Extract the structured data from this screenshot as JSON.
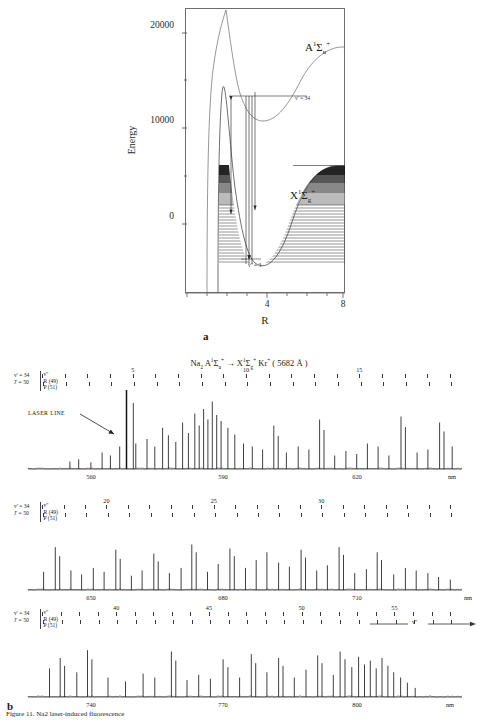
{
  "figure": {
    "caption": "Figure 11. Na2 laser-induced fluorescence",
    "panel_a_label": "a",
    "panel_b_label": "b"
  },
  "panel_a": {
    "type": "potential-energy-curves",
    "ylabel": "Energy",
    "xlabel": "R",
    "yticks": [
      0,
      10000,
      20000
    ],
    "ytick_labels": [
      "0",
      "10000",
      "20000"
    ],
    "yminor": [
      5000,
      15000
    ],
    "ylim": [
      -3000,
      25500
    ],
    "xticks": [
      4,
      8
    ],
    "xtick_labels": [
      "4",
      "8"
    ],
    "xlim": [
      1.6,
      9.6
    ],
    "states": [
      {
        "name": "upper-state-label",
        "text": "A¹Σᵤ⁺",
        "base": "A",
        "sup1": "1",
        "sigma": "Σ",
        "sub": "u",
        "sup2": "+"
      },
      {
        "name": "lower-state-label",
        "text": "X¹Σg⁺",
        "base": "X",
        "sup1": "1",
        "sigma": "Σ",
        "sub": "g",
        "sup2": "+"
      }
    ],
    "annotations": [
      {
        "name": "upper-vib-level",
        "text": "v' = 34"
      },
      {
        "name": "lower-vib-level",
        "text": "v'' = 3"
      }
    ]
  },
  "panel_b": {
    "title": "Na₂ A¹Σᵤ⁺ → X¹Σg⁺  Kr⁺ ( 5682 Å )",
    "title_parts": {
      "molecule": "Na",
      "molecule_sub": "2",
      "upper": "A",
      "upper_sup": "1",
      "sigma": "Σ",
      "upper_sub": "u",
      "upper_sup2": "+",
      "arrow": "→",
      "lower": "X",
      "lower_sup": "1",
      "lower_sub": "g",
      "lower_sup2": "+",
      "laser": "Kr",
      "laser_sup": "+",
      "wavelength": "( 5682 Å )"
    },
    "quantum_numbers": {
      "vprime": "v' = 34",
      "jprime": "J' = 50",
      "header": "v''",
      "branch_r": "R (49)",
      "branch_p": "P (51)"
    },
    "laser_line_label": "LASER LINE",
    "vpp_axis_label": "v''",
    "wavelength_unit": "nm",
    "traces": [
      {
        "name": "spectrum-trace-1",
        "xticks": [
          560,
          590,
          620
        ],
        "xtick_labels": [
          "560",
          "590",
          "620"
        ],
        "xlim": [
          548,
          637
        ],
        "vpp_marks": [
          5,
          10,
          15
        ],
        "vpp_range": [
          1,
          19
        ]
      },
      {
        "name": "spectrum-trace-2",
        "xticks": [
          650,
          680,
          710
        ],
        "xtick_labels": [
          "650",
          "680",
          "710"
        ],
        "xlim": [
          637,
          726
        ],
        "vpp_marks": [
          20,
          25,
          30
        ],
        "vpp_range": [
          17,
          36
        ]
      },
      {
        "name": "spectrum-trace-3",
        "xticks": [
          740,
          770,
          800
        ],
        "xtick_labels": [
          "740",
          "770",
          "800"
        ],
        "xlim": [
          726,
          815
        ],
        "vpp_marks": [
          40,
          45,
          50,
          55
        ],
        "vpp_range": [
          36,
          58
        ]
      }
    ]
  },
  "chart_data": {
    "type": "line",
    "xlabel": "Wavelength (nm)",
    "ylabel": "Fluorescence intensity",
    "panels": [
      {
        "name": "spectrum-trace-1",
        "xlim": [
          548,
          637
        ],
        "xticks": [
          560,
          590,
          620
        ],
        "peaks": [
          [
            556.6,
            0.1
          ],
          [
            558.4,
            0.13
          ],
          [
            560.9,
            0.09
          ],
          [
            563.2,
            0.22
          ],
          [
            564.9,
            0.18
          ],
          [
            566.8,
            0.3
          ],
          [
            568.2,
            0.24
          ],
          [
            569.6,
            0.88
          ],
          [
            570.1,
            0.34
          ],
          [
            572.4,
            0.4
          ],
          [
            574.0,
            0.3
          ],
          [
            575.6,
            0.55
          ],
          [
            576.8,
            0.45
          ],
          [
            578.3,
            0.36
          ],
          [
            579.7,
            0.62
          ],
          [
            580.9,
            0.48
          ],
          [
            582.2,
            0.74
          ],
          [
            583.1,
            0.58
          ],
          [
            584.0,
            0.8
          ],
          [
            584.9,
            0.66
          ],
          [
            585.8,
            0.9
          ],
          [
            586.7,
            0.72
          ],
          [
            587.6,
            0.64
          ],
          [
            589.0,
            0.55
          ],
          [
            590.4,
            0.46
          ],
          [
            592.2,
            0.34
          ],
          [
            594.0,
            0.3
          ],
          [
            596.1,
            0.26
          ],
          [
            598.4,
            0.58
          ],
          [
            599.3,
            0.44
          ],
          [
            601.0,
            0.22
          ],
          [
            603.4,
            0.3
          ],
          [
            605.6,
            0.26
          ],
          [
            607.8,
            0.66
          ],
          [
            608.7,
            0.52
          ],
          [
            610.9,
            0.18
          ],
          [
            613.2,
            0.24
          ],
          [
            615.4,
            0.2
          ],
          [
            617.6,
            0.34
          ],
          [
            619.8,
            0.3
          ],
          [
            622.0,
            0.18
          ],
          [
            624.5,
            0.7
          ],
          [
            625.4,
            0.56
          ],
          [
            627.8,
            0.22
          ],
          [
            630.0,
            0.26
          ],
          [
            632.4,
            0.62
          ],
          [
            633.3,
            0.5
          ],
          [
            635.0,
            0.3
          ]
        ],
        "laser_line_nm": 568.2
      },
      {
        "name": "spectrum-trace-2",
        "xlim": [
          637,
          726
        ],
        "xticks": [
          650,
          680,
          710
        ],
        "peaks": [
          [
            640.2,
            0.28
          ],
          [
            642.6,
            0.66
          ],
          [
            643.5,
            0.52
          ],
          [
            645.8,
            0.3
          ],
          [
            648.0,
            0.24
          ],
          [
            650.4,
            0.34
          ],
          [
            652.6,
            0.28
          ],
          [
            655.0,
            0.62
          ],
          [
            655.9,
            0.48
          ],
          [
            658.2,
            0.22
          ],
          [
            660.4,
            0.3
          ],
          [
            662.8,
            0.56
          ],
          [
            663.7,
            0.44
          ],
          [
            666.0,
            0.26
          ],
          [
            668.4,
            0.34
          ],
          [
            670.6,
            0.7
          ],
          [
            671.5,
            0.58
          ],
          [
            673.8,
            0.28
          ],
          [
            676.0,
            0.4
          ],
          [
            678.4,
            0.64
          ],
          [
            679.3,
            0.52
          ],
          [
            681.6,
            0.34
          ],
          [
            683.8,
            0.46
          ],
          [
            686.0,
            0.58
          ],
          [
            688.4,
            0.42
          ],
          [
            690.6,
            0.36
          ],
          [
            693.0,
            0.62
          ],
          [
            693.9,
            0.5
          ],
          [
            696.2,
            0.3
          ],
          [
            698.4,
            0.38
          ],
          [
            700.8,
            0.66
          ],
          [
            701.7,
            0.54
          ],
          [
            704.0,
            0.26
          ],
          [
            706.4,
            0.32
          ],
          [
            708.6,
            0.58
          ],
          [
            709.5,
            0.46
          ],
          [
            712.0,
            0.24
          ],
          [
            714.4,
            0.34
          ],
          [
            716.6,
            0.3
          ],
          [
            719.0,
            0.26
          ],
          [
            721.2,
            0.2
          ],
          [
            723.6,
            0.16
          ]
        ]
      },
      {
        "name": "spectrum-trace-3",
        "xlim": [
          726,
          815
        ],
        "xticks": [
          740,
          770,
          800
        ],
        "peaks": [
          [
            730.4,
            0.44
          ],
          [
            732.6,
            0.6
          ],
          [
            733.5,
            0.48
          ],
          [
            736.0,
            0.38
          ],
          [
            738.2,
            0.72
          ],
          [
            739.1,
            0.58
          ],
          [
            742.4,
            0.3
          ],
          [
            746.0,
            0.24
          ],
          [
            749.6,
            0.36
          ],
          [
            752.0,
            0.3
          ],
          [
            755.4,
            0.7
          ],
          [
            756.3,
            0.56
          ],
          [
            758.6,
            0.26
          ],
          [
            761.0,
            0.34
          ],
          [
            763.4,
            0.28
          ],
          [
            766.0,
            0.58
          ],
          [
            767.0,
            0.46
          ],
          [
            769.4,
            0.3
          ],
          [
            771.8,
            0.66
          ],
          [
            772.7,
            0.52
          ],
          [
            775.0,
            0.38
          ],
          [
            777.4,
            0.6
          ],
          [
            778.3,
            0.48
          ],
          [
            780.6,
            0.3
          ],
          [
            783.0,
            0.42
          ],
          [
            785.4,
            0.64
          ],
          [
            786.3,
            0.52
          ],
          [
            788.6,
            0.34
          ],
          [
            790.0,
            0.7
          ],
          [
            791.0,
            0.58
          ],
          [
            792.4,
            0.46
          ],
          [
            793.8,
            0.62
          ],
          [
            795.0,
            0.5
          ],
          [
            796.2,
            0.56
          ],
          [
            797.4,
            0.44
          ],
          [
            798.6,
            0.6
          ],
          [
            799.8,
            0.48
          ],
          [
            801.0,
            0.38
          ],
          [
            802.4,
            0.3
          ],
          [
            803.8,
            0.22
          ],
          [
            805.4,
            0.14
          ]
        ]
      }
    ]
  }
}
